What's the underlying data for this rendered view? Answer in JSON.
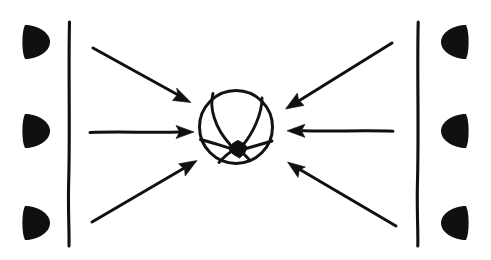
{
  "figure": {
    "canvas": {
      "width": 491,
      "height": 260
    },
    "colors": {
      "ink": "#101010",
      "background": "#ffffff"
    }
  },
  "left_wall": {
    "name": "left-boundary-line",
    "x": 69,
    "y_top": 22,
    "y_bottom": 246
  },
  "right_wall": {
    "name": "right-boundary-line",
    "x": 418,
    "y_top": 22,
    "y_bottom": 246
  },
  "left_markers": [
    {
      "label": "left-marker-top",
      "cx": 34,
      "cy": 42,
      "r": 17,
      "bulge": "right"
    },
    {
      "label": "left-marker-middle",
      "cx": 34,
      "cy": 131,
      "r": 17,
      "bulge": "right"
    },
    {
      "label": "left-marker-bottom",
      "cx": 34,
      "cy": 223,
      "r": 17,
      "bulge": "right"
    }
  ],
  "right_markers": [
    {
      "label": "right-marker-top",
      "cx": 455,
      "cy": 42,
      "r": 17,
      "bulge": "left"
    },
    {
      "label": "right-marker-middle",
      "cx": 455,
      "cy": 131,
      "r": 17,
      "bulge": "left"
    },
    {
      "label": "right-marker-bottom",
      "cx": 455,
      "cy": 223,
      "r": 17,
      "bulge": "left"
    }
  ],
  "arrows": [
    {
      "label": "arrow-upper-left",
      "x1": 93,
      "y1": 48,
      "x2": 188,
      "y2": 101,
      "direction": "down-right"
    },
    {
      "label": "arrow-middle-left",
      "x1": 90,
      "y1": 132,
      "x2": 191,
      "y2": 132,
      "direction": "right"
    },
    {
      "label": "arrow-lower-left",
      "x1": 92,
      "y1": 222,
      "x2": 194,
      "y2": 162,
      "direction": "up-right"
    },
    {
      "label": "arrow-upper-right",
      "x1": 392,
      "y1": 43,
      "x2": 289,
      "y2": 107,
      "direction": "down-left"
    },
    {
      "label": "arrow-middle-right",
      "x1": 393,
      "y1": 131,
      "x2": 289,
      "y2": 131,
      "direction": "left"
    },
    {
      "label": "arrow-lower-right",
      "x1": 396,
      "y1": 226,
      "x2": 289,
      "y2": 163,
      "direction": "up-left"
    }
  ],
  "sphere": {
    "label": "central-sphere",
    "cx": 236,
    "cy": 127,
    "r": 37,
    "node": {
      "label": "central-node",
      "cx": 238,
      "cy": 148,
      "r": 7
    },
    "seams": [
      {
        "label": "seam-top-left",
        "from": "top-left-arc",
        "to": "node"
      },
      {
        "label": "seam-top-right",
        "from": "top-right-arc",
        "to": "node"
      },
      {
        "label": "seam-left",
        "from": "left-arc",
        "to": "node"
      },
      {
        "label": "seam-right",
        "from": "right-arc",
        "to": "node"
      },
      {
        "label": "seam-bottom-left",
        "from": "bottom-left-arc",
        "to": "node"
      },
      {
        "label": "seam-bottom-right",
        "from": "bottom-right-arc",
        "to": "node"
      }
    ]
  }
}
